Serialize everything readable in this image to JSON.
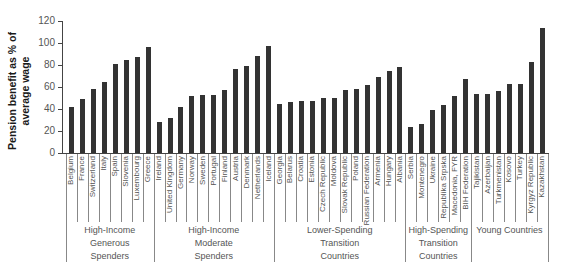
{
  "chart_data": {
    "type": "bar",
    "title": "",
    "xlabel": "",
    "ylabel": "Pension benefit as % of average wage",
    "ylim": [
      0,
      120
    ],
    "yticks": [
      0,
      20,
      40,
      60,
      80,
      100,
      120
    ],
    "grid": false,
    "legend": null,
    "groups": [
      {
        "label": "High-Income Generous Spenders",
        "label_lines": [
          "High-Income",
          "Generous",
          "Spenders"
        ],
        "categories": [
          "Belgium",
          "France",
          "Switzerland",
          "Italy",
          "Spain",
          "Slovenia",
          "Luxembourg",
          "Greece"
        ],
        "values": [
          42,
          49,
          58,
          65,
          81,
          85,
          87,
          96
        ]
      },
      {
        "label": "High-Income Moderate Spenders",
        "label_lines": [
          "High-Income",
          "Moderate",
          "Spenders"
        ],
        "categories": [
          "Ireland",
          "United Kingdom",
          "Germany",
          "Norway",
          "Sweden",
          "Portugal",
          "Finland",
          "Austria",
          "Denmark",
          "Netherlands",
          "Iceland"
        ],
        "values": [
          28,
          32,
          42,
          52,
          53,
          53,
          57,
          76,
          79,
          88,
          97
        ]
      },
      {
        "label": "Lower-Spending Transition Countries",
        "label_lines": [
          "Lower-Spending",
          "Transition",
          "Countries"
        ],
        "categories": [
          "Georgia",
          "Belarus",
          "Croatia",
          "Estonia",
          "Czech Republic",
          "Moldova",
          "Slovak Republic",
          "Poland",
          "Russian Federation",
          "Armenia",
          "Hungary",
          "Albania"
        ],
        "values": [
          45,
          46,
          47,
          47,
          50,
          50,
          57,
          58,
          62,
          69,
          75,
          78
        ]
      },
      {
        "label": "High-Spending Transition Countries",
        "label_lines": [
          "High-Spending",
          "Transition",
          "Countries"
        ],
        "categories": [
          "Serbia",
          "Montenegro",
          "Ukraine",
          "Republika Srpska",
          "Macedonia, FYR",
          "BIH Federation"
        ],
        "values": [
          24,
          26,
          39,
          44,
          52,
          67
        ]
      },
      {
        "label": "Young Countries",
        "label_lines": [
          "Young Countries"
        ],
        "categories": [
          "Tajikistan",
          "Azerbaijan",
          "Turkmenistan",
          "Kosovo",
          "Turkey",
          "Kyrgyz Republic",
          "Kazakhstan"
        ],
        "values": [
          54,
          54,
          56,
          63,
          63,
          83,
          114
        ]
      }
    ],
    "categories": [
      "Belgium",
      "France",
      "Switzerland",
      "Italy",
      "Spain",
      "Slovenia",
      "Luxembourg",
      "Greece",
      "Ireland",
      "United Kingdom",
      "Germany",
      "Norway",
      "Sweden",
      "Portugal",
      "Finland",
      "Austria",
      "Denmark",
      "Netherlands",
      "Iceland",
      "Georgia",
      "Belarus",
      "Croatia",
      "Estonia",
      "Czech Republic",
      "Moldova",
      "Slovak Republic",
      "Poland",
      "Russian Federation",
      "Armenia",
      "Hungary",
      "Albania",
      "Serbia",
      "Montenegro",
      "Ukraine",
      "Republika Srpska",
      "Macedonia, FYR",
      "BIH Federation",
      "Tajikistan",
      "Azerbaijan",
      "Turkmenistan",
      "Kosovo",
      "Turkey",
      "Kyrgyz Republic",
      "Kazakhstan"
    ],
    "values": [
      42,
      49,
      58,
      65,
      81,
      85,
      87,
      96,
      28,
      32,
      42,
      52,
      53,
      53,
      57,
      76,
      79,
      88,
      97,
      45,
      46,
      47,
      47,
      50,
      50,
      57,
      58,
      62,
      69,
      75,
      78,
      24,
      26,
      39,
      44,
      52,
      67,
      54,
      54,
      56,
      63,
      63,
      83,
      114
    ]
  },
  "colors": {
    "bar": "#333333",
    "axis": "#444444",
    "text": "#555555"
  }
}
